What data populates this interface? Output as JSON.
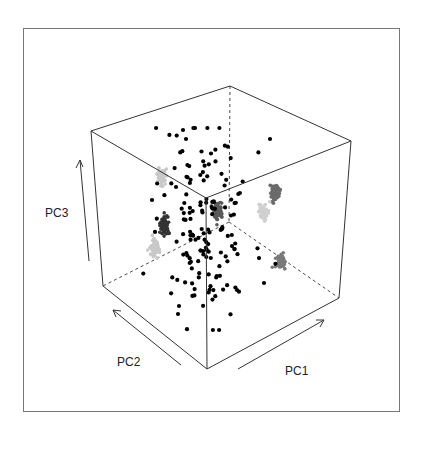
{
  "chart_data": {
    "type": "scatter",
    "title": "",
    "subtitle": "",
    "projection": "3d",
    "axes": {
      "x": {
        "label": "PC1"
      },
      "y": {
        "label": "PC2"
      },
      "z": {
        "label": "PC3"
      }
    },
    "grid": false,
    "legend": null,
    "box": {
      "frame": [
        23,
        28,
        399,
        411
      ],
      "vertices": {
        "top_left": [
          91,
          131
        ],
        "top_front": [
          206,
          198
        ],
        "top_right": [
          351,
          141
        ],
        "top_back": [
          230,
          86
        ],
        "bottom_left": [
          103,
          286
        ],
        "bottom_front": [
          207,
          369
        ],
        "bottom_right": [
          339,
          298
        ],
        "bottom_back": [
          229,
          222
        ]
      }
    },
    "series": [
      {
        "name": "3D points (black)",
        "color": "#000000",
        "description": "~150 scattered black points centered in cube"
      },
      {
        "name": "PC2-PC3 projection (dark)",
        "color": "#333333",
        "center": [
          165,
          226
        ]
      },
      {
        "name": "PC1-PC3 projection (medium grey)",
        "color": "#6b6b6b",
        "center": [
          275,
          192
        ]
      },
      {
        "name": "PC1-PC2 projection (grey)",
        "color": "#7a7a7a",
        "center": [
          281,
          262
        ]
      },
      {
        "name": "light projection left-top",
        "color": "#c8c8c8",
        "center": [
          161,
          177
        ]
      },
      {
        "name": "light projection left-bottom",
        "color": "#c8c8c8",
        "center": [
          155,
          249
        ]
      },
      {
        "name": "light projection right",
        "color": "#d0d0d0",
        "center": [
          264,
          212
        ]
      },
      {
        "name": "center projection",
        "color": "#5a5a5a",
        "center": [
          218,
          210
        ]
      }
    ]
  },
  "labels": {
    "pc1": "PC1",
    "pc2": "PC2",
    "pc3": "PC3"
  }
}
